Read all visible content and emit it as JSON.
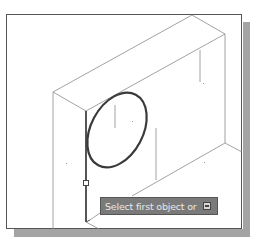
{
  "scene": {
    "description": "Isometric 3D box in CAD viewport with ellipse on front face",
    "colors": {
      "background": "#ffffff",
      "edge": "#8a8a8a",
      "highlight": "#333333",
      "shadow": "#a4a4a4",
      "tooltip_bg": "#7a7a7a"
    }
  },
  "tooltip": {
    "prompt": "Select first object or",
    "options_icon": "down-arrow-icon"
  }
}
